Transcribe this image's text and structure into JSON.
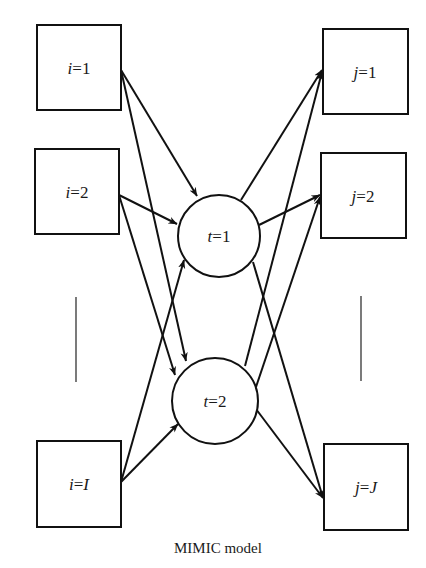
{
  "diagram": {
    "caption": "MIMIC model",
    "stroke_color": "#111111",
    "inputs": [
      {
        "id": "i1",
        "var": "i",
        "eq": "=",
        "val": "1",
        "val_italic": false
      },
      {
        "id": "i2",
        "var": "i",
        "eq": "=",
        "val": "2",
        "val_italic": false
      },
      {
        "id": "iI",
        "var": "i",
        "eq": "=",
        "val": "I",
        "val_italic": true
      }
    ],
    "latents": [
      {
        "id": "t1",
        "var": "t",
        "eq": "=",
        "val": "1"
      },
      {
        "id": "t2",
        "var": "t",
        "eq": "=",
        "val": "2"
      }
    ],
    "outputs": [
      {
        "id": "j1",
        "var": "j",
        "eq": "=",
        "val": "1",
        "val_italic": false
      },
      {
        "id": "j2",
        "var": "j",
        "eq": "=",
        "val": "2",
        "val_italic": false
      },
      {
        "id": "jJ",
        "var": "j",
        "eq": "=",
        "val": "J",
        "val_italic": true
      }
    ],
    "edges": [
      [
        "i1",
        "t1"
      ],
      [
        "i1",
        "t2"
      ],
      [
        "i2",
        "t1"
      ],
      [
        "i2",
        "t2"
      ],
      [
        "iI",
        "t1"
      ],
      [
        "iI",
        "t2"
      ],
      [
        "t1",
        "j1"
      ],
      [
        "t1",
        "j2"
      ],
      [
        "t1",
        "jJ"
      ],
      [
        "t2",
        "j1"
      ],
      [
        "t2",
        "j2"
      ],
      [
        "t2",
        "jJ"
      ]
    ],
    "ellipsis": [
      "inputs",
      "outputs"
    ]
  }
}
